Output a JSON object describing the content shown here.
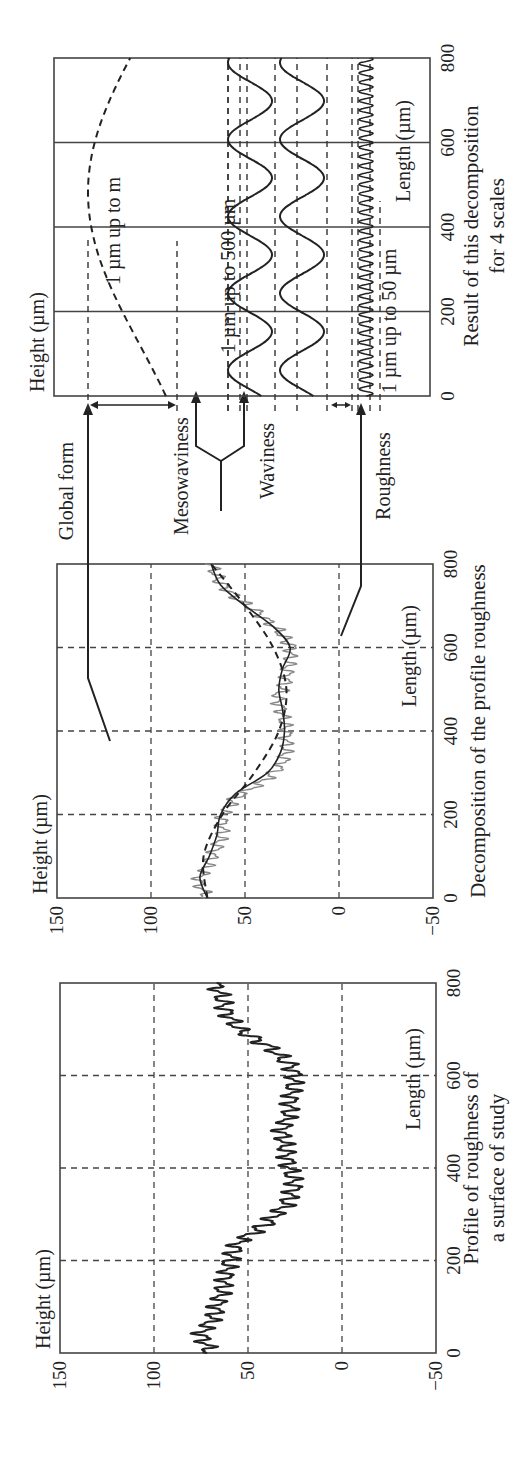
{
  "figure": {
    "panels": [
      {
        "id": "profile",
        "caption_line1": "Profile of roughness of",
        "caption_line2": "a surface of study",
        "ylabel": "Height (µm)",
        "xlabel": "Length (µm)",
        "yticks": [
          "150",
          "100",
          "50",
          "0",
          "−50"
        ],
        "xticks": [
          "0",
          "200",
          "400",
          "600",
          "800"
        ]
      },
      {
        "id": "decomposition",
        "caption": "Decomposition of the profile roughness",
        "ylabel": "Height (µm)",
        "xlabel": "Length (µm)",
        "yticks": [
          "150",
          "100",
          "50",
          "0",
          "−50"
        ],
        "xticks": [
          "0",
          "200",
          "400",
          "600",
          "800"
        ]
      },
      {
        "id": "result",
        "caption_line1": "Result of this decomposition",
        "caption_line2": "for 4 scales",
        "ylabel": "Height (µm)",
        "xlabel": "Length (µm)",
        "xticks": [
          "0",
          "200",
          "400",
          "600",
          "800"
        ],
        "strip_labels": [
          "1 µm up to m",
          "1 µm up to 500 µm",
          "1 µm up to 50 µm"
        ]
      }
    ],
    "arrows": {
      "global_form": "Global form",
      "mesowaviness": "Mesowaviness",
      "waviness": "Waviness",
      "roughness": "Roughness"
    }
  },
  "chart_data": [
    {
      "type": "line",
      "title": "Profile of roughness of a surface of study",
      "xlabel": "Length (µm)",
      "ylabel": "Height (µm)",
      "xlim": [
        0,
        800
      ],
      "ylim": [
        -50,
        150
      ],
      "xticks": [
        0,
        200,
        400,
        600,
        800
      ],
      "yticks": [
        -50,
        0,
        50,
        100,
        150
      ],
      "grid": "dashed",
      "series": [
        {
          "name": "Measured roughness profile",
          "x": [
            0,
            40,
            80,
            120,
            160,
            200,
            240,
            280,
            320,
            360,
            400,
            440,
            480,
            520,
            560,
            600,
            620,
            660,
            700,
            740,
            780,
            800
          ],
          "y": [
            70,
            75,
            68,
            65,
            62,
            60,
            55,
            40,
            30,
            25,
            28,
            30,
            32,
            28,
            27,
            25,
            27,
            38,
            55,
            62,
            65,
            68
          ]
        }
      ]
    },
    {
      "type": "line",
      "title": "Decomposition of the profile roughness",
      "xlabel": "Length (µm)",
      "ylabel": "Height (µm)",
      "xlim": [
        0,
        800
      ],
      "ylim": [
        -50,
        150
      ],
      "xticks": [
        0,
        200,
        400,
        600,
        800
      ],
      "yticks": [
        -50,
        0,
        50,
        100,
        150
      ],
      "grid": "dashed",
      "series": [
        {
          "name": "Raw profile (gray)",
          "x": [
            0,
            40,
            80,
            120,
            160,
            200,
            240,
            280,
            320,
            360,
            400,
            440,
            480,
            520,
            560,
            600,
            640,
            680,
            720,
            760,
            800
          ],
          "y": [
            70,
            75,
            70,
            65,
            62,
            62,
            55,
            40,
            30,
            28,
            28,
            30,
            33,
            28,
            27,
            25,
            32,
            42,
            55,
            64,
            68
          ]
        },
        {
          "name": "Waviness (smooth solid)",
          "x": [
            0,
            50,
            100,
            150,
            200,
            250,
            300,
            350,
            400,
            450,
            500,
            550,
            600,
            650,
            700,
            750,
            800
          ],
          "y": [
            70,
            74,
            69,
            65,
            63,
            55,
            38,
            31,
            29,
            30,
            32,
            30,
            26,
            35,
            50,
            63,
            68
          ]
        },
        {
          "name": "Global form (dashed)",
          "x": [
            0,
            100,
            200,
            300,
            400,
            500,
            600,
            700,
            800
          ],
          "y": [
            70,
            72,
            62,
            45,
            32,
            28,
            35,
            50,
            68
          ]
        }
      ]
    },
    {
      "type": "line",
      "title": "Result of this decomposition for 4 scales",
      "xlabel": "Length (µm)",
      "ylabel": "Height (µm)",
      "xlim": [
        0,
        800
      ],
      "xticks": [
        0,
        200,
        400,
        600,
        800
      ],
      "grid": "vertical solid",
      "series": [
        {
          "name": "Global form (1 µm up to m)",
          "shape": "single broad dashed wave"
        },
        {
          "name": "Mesowaviness (1 µm up to 500 µm)",
          "shape": "medium sine wave"
        },
        {
          "name": "Waviness",
          "shape": "medium sine wave"
        },
        {
          "name": "Roughness (1 µm up to 50 µm)",
          "shape": "high-frequency oscillation"
        }
      ]
    }
  ]
}
